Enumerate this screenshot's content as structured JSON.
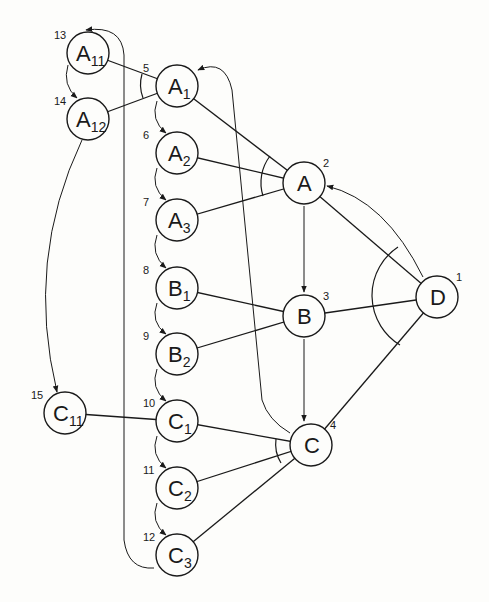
{
  "diagram": {
    "type": "and-or search graph",
    "nodes": [
      {
        "id": "D",
        "label": "D",
        "sub": "",
        "order": "1",
        "x": 437,
        "y": 297
      },
      {
        "id": "A",
        "label": "A",
        "sub": "",
        "order": "2",
        "x": 304,
        "y": 183
      },
      {
        "id": "B",
        "label": "B",
        "sub": "",
        "order": "3",
        "x": 304,
        "y": 316
      },
      {
        "id": "C",
        "label": "C",
        "sub": "",
        "order": "4",
        "x": 311,
        "y": 445
      },
      {
        "id": "A1",
        "label": "A",
        "sub": "1",
        "order": "5",
        "x": 177,
        "y": 86
      },
      {
        "id": "A2",
        "label": "A",
        "sub": "2",
        "order": "6",
        "x": 177,
        "y": 153
      },
      {
        "id": "A3",
        "label": "A",
        "sub": "3",
        "order": "7",
        "x": 177,
        "y": 220
      },
      {
        "id": "B1",
        "label": "B",
        "sub": "1",
        "order": "8",
        "x": 177,
        "y": 288
      },
      {
        "id": "B2",
        "label": "B",
        "sub": "2",
        "order": "9",
        "x": 177,
        "y": 354
      },
      {
        "id": "C1",
        "label": "C",
        "sub": "1",
        "order": "10",
        "x": 177,
        "y": 421
      },
      {
        "id": "C2",
        "label": "C",
        "sub": "2",
        "order": "11",
        "x": 177,
        "y": 488
      },
      {
        "id": "C3",
        "label": "C",
        "sub": "3",
        "order": "12",
        "x": 177,
        "y": 555
      },
      {
        "id": "A11",
        "label": "A",
        "sub": "11",
        "order": "13",
        "x": 88,
        "y": 53
      },
      {
        "id": "A12",
        "label": "A",
        "sub": "12",
        "order": "14",
        "x": 88,
        "y": 119
      },
      {
        "id": "C11",
        "label": "C",
        "sub": "11",
        "order": "15",
        "x": 65,
        "y": 413
      }
    ],
    "edges": [
      [
        "D",
        "A"
      ],
      [
        "D",
        "B"
      ],
      [
        "D",
        "C"
      ],
      [
        "A",
        "A1"
      ],
      [
        "A",
        "A2"
      ],
      [
        "A",
        "A3"
      ],
      [
        "B",
        "B1"
      ],
      [
        "B",
        "B2"
      ],
      [
        "C",
        "C1"
      ],
      [
        "C",
        "C2"
      ],
      [
        "C",
        "C3"
      ],
      [
        "A1",
        "A11"
      ],
      [
        "A1",
        "A12"
      ],
      [
        "C1",
        "C11"
      ]
    ],
    "and_arcs": [
      "D",
      "A",
      "B",
      "C",
      "A1"
    ],
    "order_arrows": [
      [
        "D",
        "A"
      ],
      [
        "A",
        "B"
      ],
      [
        "B",
        "C"
      ],
      [
        "C",
        "A1"
      ],
      [
        "A1",
        "A2"
      ],
      [
        "A2",
        "A3"
      ],
      [
        "A3",
        "B1"
      ],
      [
        "B1",
        "B2"
      ],
      [
        "B2",
        "C1"
      ],
      [
        "C1",
        "C2"
      ],
      [
        "C2",
        "C3"
      ],
      [
        "C3",
        "A11"
      ],
      [
        "A11",
        "A12"
      ],
      [
        "A12",
        "C11"
      ]
    ]
  }
}
